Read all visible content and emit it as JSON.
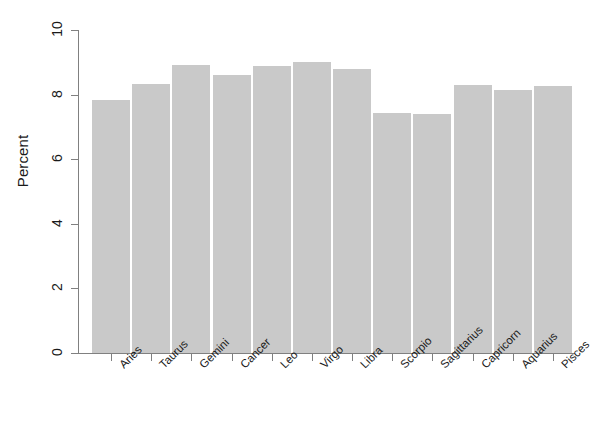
{
  "chart_data": {
    "type": "bar",
    "title": "",
    "subtitle": "",
    "xlabel": "",
    "ylabel": "Percent",
    "categories": [
      "Aries",
      "Taurus",
      "Gemini",
      "Cancer",
      "Leo",
      "Virgo",
      "Libra",
      "Scorpio",
      "Sagittarius",
      "Capricorn",
      "Aquarius",
      "Pisces"
    ],
    "values": [
      7.83,
      8.33,
      8.92,
      8.6,
      8.88,
      9.02,
      8.78,
      7.43,
      7.4,
      8.3,
      8.15,
      8.28
    ],
    "ylim": [
      0,
      10
    ],
    "yticks": [
      0,
      2,
      4,
      6,
      8,
      10
    ],
    "ytick_labels": [
      "0",
      "2",
      "4",
      "6",
      "8",
      "10"
    ],
    "grid": false,
    "legend": false,
    "legend_position": "none",
    "bar_color": "#c9c9c9",
    "axis_color": "#808080",
    "text_color": "#1a1a1a",
    "background_color": "#ffffff",
    "xtick_label_rotation": -45
  }
}
